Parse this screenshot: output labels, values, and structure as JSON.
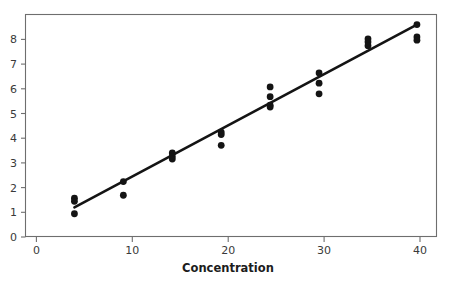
{
  "chart_data": {
    "type": "scatter",
    "title": "",
    "subtitle": "",
    "xlabel": "Concentration",
    "ylabel": "",
    "xlim": [
      0,
      42
    ],
    "ylim": [
      0,
      8.4
    ],
    "grid": false,
    "legend": "none",
    "x_ticks": [
      0,
      10,
      20,
      30,
      40
    ],
    "x_tick_labels": [
      "0",
      "10",
      "20",
      "30",
      "40"
    ],
    "y_ticks": [
      0,
      1,
      2,
      3,
      4,
      5,
      6,
      7,
      8
    ],
    "y_tick_labels": [
      "0",
      "1",
      "2",
      "3",
      "4",
      "5",
      "6",
      "7",
      "8"
    ],
    "series": [
      {
        "name": "observations",
        "type": "scatter",
        "marker": "filled-circle",
        "color": "#141414",
        "points": [
          {
            "x": 5,
            "y": 1.45
          },
          {
            "x": 5,
            "y": 1.33
          },
          {
            "x": 5,
            "y": 0.86
          },
          {
            "x": 10,
            "y": 2.08
          },
          {
            "x": 10,
            "y": 1.56
          },
          {
            "x": 15,
            "y": 3.16
          },
          {
            "x": 15,
            "y": 3.03
          },
          {
            "x": 15,
            "y": 2.93
          },
          {
            "x": 20,
            "y": 3.95
          },
          {
            "x": 20,
            "y": 3.86
          },
          {
            "x": 20,
            "y": 3.45
          },
          {
            "x": 25,
            "y": 5.66
          },
          {
            "x": 25,
            "y": 5.29
          },
          {
            "x": 25,
            "y": 4.97
          },
          {
            "x": 25,
            "y": 4.9
          },
          {
            "x": 30,
            "y": 6.19
          },
          {
            "x": 30,
            "y": 5.8
          },
          {
            "x": 30,
            "y": 5.4
          },
          {
            "x": 35,
            "y": 7.48
          },
          {
            "x": 35,
            "y": 7.36
          },
          {
            "x": 35,
            "y": 7.22
          },
          {
            "x": 40,
            "y": 8.02
          },
          {
            "x": 40,
            "y": 7.55
          },
          {
            "x": 40,
            "y": 7.43
          }
        ]
      },
      {
        "name": "fitted-regression-line",
        "type": "line",
        "color": "#141414",
        "x_start": 5,
        "y_start": 1.1,
        "x_end": 40,
        "y_end": 8.02,
        "slope": 0.1977,
        "intercept": 0.111
      }
    ]
  },
  "axes": {
    "x_axis_title": "Concentration",
    "y_axis_title": ""
  }
}
